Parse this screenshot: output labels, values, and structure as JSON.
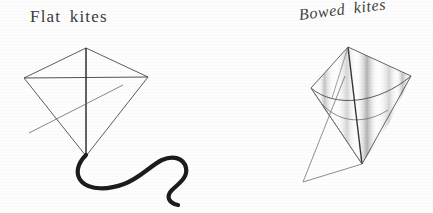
{
  "figure": {
    "title": "",
    "background_color": "#fdfdfd",
    "ink_color": "#3a3a3a",
    "tail_color": "#1c1c1c",
    "shade_color": "#b9b9b9"
  },
  "panels": [
    {
      "id": "flat-kite",
      "caption": "Flat kites",
      "description": "flat diamond kite with straight cross spars and a long wavy tail",
      "parts": [
        "sail-outline",
        "vertical-spine",
        "horizontal-spar",
        "bridle-lines",
        "tail"
      ]
    },
    {
      "id": "bowed-kite",
      "caption": "Bowed kites",
      "description": "bowed kite drawn in perspective with curved sail and shaded panels",
      "parts": [
        "sail-outline",
        "bowed-spar",
        "vertical-spine",
        "bridle-lines",
        "shading-bands"
      ]
    }
  ],
  "captions": {
    "flat": "Flat kites",
    "bowed": "Bowed kites"
  }
}
